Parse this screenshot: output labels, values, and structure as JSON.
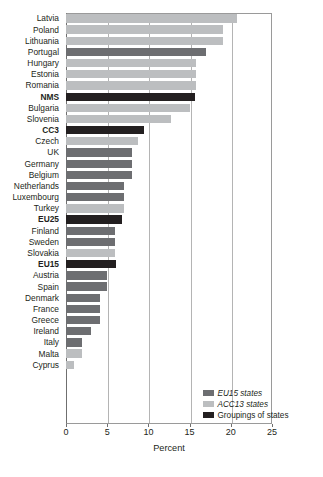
{
  "chart_data": {
    "type": "bar",
    "orientation": "horizontal",
    "title": "",
    "xlabel": "Percent",
    "ylabel": "",
    "xlim": [
      0,
      25
    ],
    "xticks": [
      0,
      5,
      10,
      15,
      20,
      25
    ],
    "xtick_labels": [
      "0",
      "5",
      "10",
      "15",
      "20",
      "25"
    ],
    "grid": true,
    "grid_axis": "x",
    "legend_position": "bottom-right",
    "legend": [
      {
        "label": "EU15 states",
        "color": "#6d6e71",
        "italic": true
      },
      {
        "label": "ACC13 states",
        "color": "#bcbec0",
        "italic": true
      },
      {
        "label": "Groupings of states",
        "color": "#231f20",
        "italic": false
      }
    ],
    "categories": [
      "Latvia",
      "Poland",
      "Lithuania",
      "Portugal",
      "Hungary",
      "Estonia",
      "Romania",
      "NMS",
      "Bulgaria",
      "Slovenia",
      "CC3",
      "Czech",
      "UK",
      "Germany",
      "Belgium",
      "Netherlands",
      "Luxembourg",
      "Turkey",
      "EU25",
      "Finland",
      "Sweden",
      "Slovakia",
      "EU15",
      "Austria",
      "Spain",
      "Denmark",
      "France",
      "Greece",
      "Ireland",
      "Italy",
      "Malta",
      "Cyprus"
    ],
    "values": [
      20.8,
      19.0,
      19.0,
      17.0,
      15.8,
      15.8,
      15.8,
      15.7,
      15.0,
      12.8,
      9.5,
      8.7,
      8.0,
      8.0,
      8.0,
      7.0,
      7.0,
      7.0,
      6.8,
      6.0,
      6.0,
      5.9,
      6.1,
      5.0,
      5.0,
      4.1,
      4.1,
      4.1,
      3.0,
      2.0,
      2.0,
      1.0
    ],
    "groups": [
      "ACC13",
      "ACC13",
      "ACC13",
      "EU15",
      "ACC13",
      "ACC13",
      "ACC13",
      "Grouping",
      "ACC13",
      "ACC13",
      "Grouping",
      "ACC13",
      "EU15",
      "EU15",
      "EU15",
      "EU15",
      "EU15",
      "ACC13",
      "Grouping",
      "EU15",
      "EU15",
      "ACC13",
      "Grouping",
      "EU15",
      "EU15",
      "EU15",
      "EU15",
      "EU15",
      "EU15",
      "EU15",
      "ACC13",
      "ACC13"
    ]
  },
  "colors": {
    "eu15": "#6d6e71",
    "acc13": "#bcbec0",
    "grouping": "#231f20",
    "gridline": "#b4b4b4",
    "axis": "#6f6f6f",
    "text": "#231f20",
    "background": "#ffffff"
  }
}
